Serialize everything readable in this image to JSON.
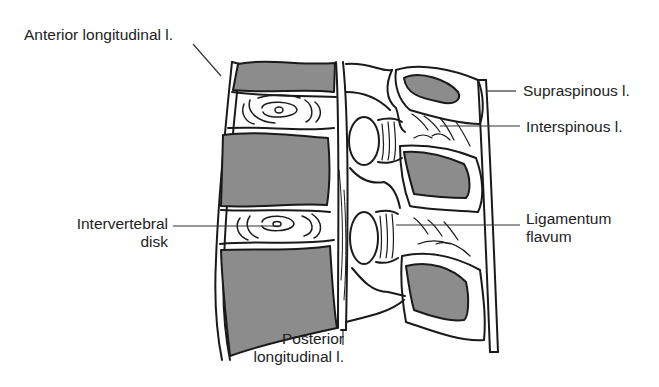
{
  "figure": {
    "colors": {
      "ink": "#1a1a1a",
      "bone_fill": "#8c8c8c",
      "paper": "#ffffff"
    },
    "labels": {
      "anterior_longitudinal": "Anterior longitudinal l.",
      "supraspinous": "Supraspinous l.",
      "interspinous": "Interspinous l.",
      "intervertebral_line1": "Intervertebral",
      "intervertebral_line2": "disk",
      "ligamentum_line1": "Ligamentum",
      "ligamentum_line2": "flavum",
      "posterior_line1": "Posterior",
      "posterior_line2": "longitudinal l."
    }
  }
}
